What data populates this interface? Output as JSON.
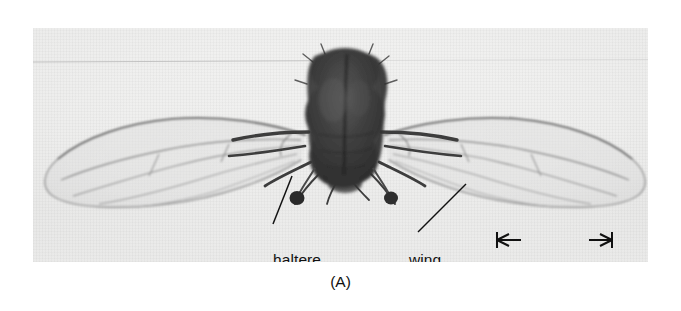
{
  "figure": {
    "panel_label": "(A)",
    "medium": "black-and-white-photograph"
  },
  "annotations": {
    "haltere": {
      "label": "haltere",
      "leader": "line-from-label-up-right-to-left-haltere-knob"
    },
    "wing": {
      "label": "wing",
      "leader": "line-from-label-up-right-to-right-wing-membrane"
    }
  },
  "scale_bar": {
    "label": "1 mm",
    "style": "double-headed-arrow-with-end-caps"
  },
  "colors": {
    "ink": "#111111",
    "plate_background": "#f1f1f0",
    "specimen_dark": "#3a3a3a",
    "wing_vein": "#8a8a8a",
    "page": "#ffffff"
  },
  "specimen": {
    "body_parts": [
      "head",
      "thorax",
      "abdomen",
      "left-wing",
      "right-wing",
      "left-haltere",
      "right-haltere",
      "legs"
    ]
  }
}
